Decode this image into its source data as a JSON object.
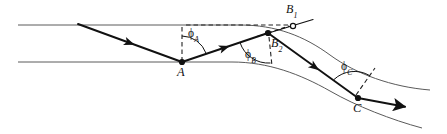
{
  "figure": {
    "width": 447,
    "height": 134,
    "background_color": "#ffffff",
    "stroke_color": "#111111",
    "boundary_color": "#4a4a4a"
  },
  "labels": {
    "point_a": "A",
    "point_b1": "B",
    "point_b1_sub": "1",
    "point_b2": "B",
    "point_b2_sub": "2",
    "point_c": "C",
    "angle_a": "ϕ",
    "angle_a_sub": "A",
    "angle_b": "ϕ",
    "angle_b_sub": "B",
    "angle_c": "ϕ",
    "angle_c_sub": "C"
  },
  "points": [
    {
      "name": "A",
      "x": 182,
      "y": 62,
      "marker": "filled",
      "label_dx": -4,
      "label_dy": 8
    },
    {
      "name": "B1",
      "x": 293,
      "y": 26,
      "marker": "hollow",
      "label_dx": -5,
      "label_dy": -22
    },
    {
      "name": "B2",
      "x": 268,
      "y": 33,
      "marker": "filled",
      "label_dx": 2,
      "label_dy": 6
    },
    {
      "name": "C",
      "x": 358,
      "y": 98,
      "marker": "filled",
      "label_dx": -5,
      "label_dy": 8
    }
  ],
  "angle_markers": [
    {
      "name": "phi-A",
      "vertex_x": 182,
      "vertex_y": 62,
      "radius": 26,
      "label_x": 186,
      "label_y": 29
    },
    {
      "name": "phi-B",
      "vertex_x": 268,
      "vertex_y": 33,
      "radius": 30,
      "label_x": 246,
      "label_y": 49
    },
    {
      "name": "phi-C",
      "vertex_x": 358,
      "vertex_y": 98,
      "radius": 30,
      "label_x": 342,
      "label_y": 62
    }
  ],
  "boundaries": [
    {
      "name": "upper-boundary",
      "description": "upper layer boundary, straight then curving downward to the right",
      "path": "M 18 25 L 240 25 C 276 25 304 36 330 55 C 356 74 392 87 430 90"
    },
    {
      "name": "lower-boundary",
      "description": "lower layer boundary, straight then curving downward to the right through A and C",
      "path": "M 18 62 L 232 62 C 268 62 300 74 330 91 C 356 106 392 120 422 128"
    }
  ],
  "rays": [
    {
      "name": "incident-ray",
      "description": "incoming downward ray from upper-left to point A",
      "path": "M 78 24 L 182 62",
      "arrow_at": {
        "x": 131,
        "y": 43.4,
        "angle_deg": 20.1
      }
    },
    {
      "name": "ray-a-to-b2",
      "description": "refracted ray from A rising to B2",
      "path": "M 182 62 L 268 33",
      "arrow_at": {
        "x": 226,
        "y": 47.2,
        "angle_deg": -18.6
      }
    },
    {
      "name": "ray-b2-to-b1-dashed-extension",
      "description": "dashed straight-line extension from B2 to virtual point B1",
      "path": "M 268 33 L 296 24"
    },
    {
      "name": "ray-b2-to-c",
      "description": "refracted ray descending from B2 to C",
      "path": "M 268 33 L 358 98",
      "arrow_at": {
        "x": 315,
        "y": 67,
        "angle_deg": 35.8
      }
    },
    {
      "name": "exit-ray",
      "description": "outgoing ray from C toward lower-right with arrowhead",
      "path": "M 358 98 L 412 108",
      "arrow_at": {
        "x": 410,
        "y": 107.6,
        "angle_deg": 10.5
      }
    },
    {
      "name": "ray-through-b1",
      "description": "short straight segment passing through virtual point B1 up-right",
      "path": "M 258 36 L 312 20"
    }
  ],
  "dashed_construction": [
    {
      "name": "horizontal-dashed-reference",
      "description": "horizontal dashed line at the upper boundary level from A's normal to B1",
      "path": "M 186 25 L 291 25"
    },
    {
      "name": "vertical-dashed-normal-at-a",
      "description": "dashed vertical normal line at point A",
      "path": "M 182 27 L 182 60"
    },
    {
      "name": "dashed-normal-at-b2",
      "description": "dashed normal line below point B2",
      "path": "M 269 36 L 272 66"
    },
    {
      "name": "dashed-normal-at-c",
      "description": "dashed normal line above point C, perpendicular to the curved boundary",
      "path": "M 356 95 L 375 68"
    }
  ]
}
